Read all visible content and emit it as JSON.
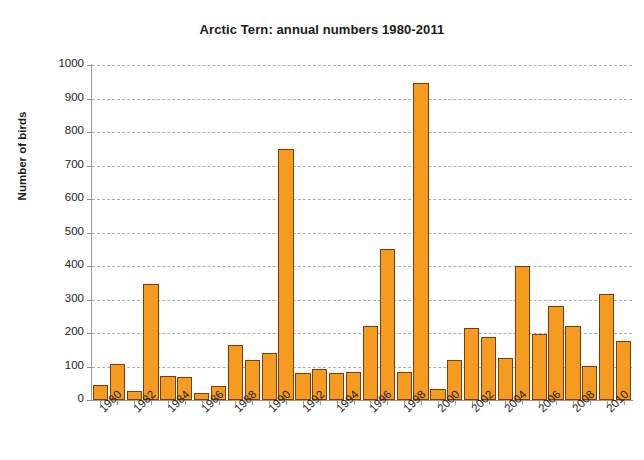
{
  "chart_data": {
    "type": "bar",
    "title": "Arctic Tern: annual numbers 1980-2011",
    "xlabel": "",
    "ylabel": "Number of birds",
    "ylim": [
      0,
      1000
    ],
    "ytick_values": [
      0,
      100,
      200,
      300,
      400,
      500,
      600,
      700,
      800,
      900,
      1000
    ],
    "ytick_labels": [
      "0",
      "100",
      "200",
      "300",
      "400",
      "500",
      "600",
      "700",
      "800",
      "900",
      "1000"
    ],
    "grid": "horizontal-dashed",
    "legend": "none",
    "bar_color": "#F59B20",
    "bar_edge_color": "#7A3C11",
    "xtick_labels": [
      "1980",
      "1982",
      "1984",
      "1986",
      "1988",
      "1990",
      "1992",
      "1994",
      "1996",
      "1998",
      "2000",
      "2002",
      "2004",
      "2006",
      "2008",
      "2010"
    ],
    "xtick_label_rotation": -45,
    "xtick_label_interval": 2,
    "categories": [
      "1980",
      "1981",
      "1982",
      "1983",
      "1984",
      "1985",
      "1986",
      "1987",
      "1988",
      "1989",
      "1990",
      "1991",
      "1992",
      "1993",
      "1994",
      "1995",
      "1996",
      "1997",
      "1998",
      "1999",
      "2000",
      "2001",
      "2002",
      "2003",
      "2004",
      "2005",
      "2006",
      "2007",
      "2008",
      "2009",
      "2010",
      "2011"
    ],
    "values": [
      45,
      108,
      28,
      345,
      72,
      70,
      22,
      42,
      163,
      118,
      140,
      750,
      80,
      92,
      82,
      85,
      222,
      450,
      85,
      945,
      32,
      118,
      215,
      188,
      125,
      400,
      197,
      280,
      220,
      102,
      315,
      175
    ],
    "series": [
      {
        "name": "Number of birds",
        "values": [
          45,
          108,
          28,
          345,
          72,
          70,
          22,
          42,
          163,
          118,
          140,
          750,
          80,
          92,
          82,
          85,
          222,
          450,
          85,
          945,
          32,
          118,
          215,
          188,
          125,
          400,
          197,
          280,
          220,
          102,
          315,
          175
        ]
      }
    ]
  }
}
